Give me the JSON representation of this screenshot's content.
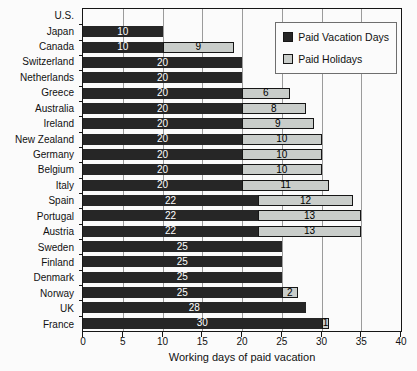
{
  "chart_data": {
    "type": "bar",
    "orientation": "horizontal",
    "stacked": true,
    "title": "",
    "xlabel": "Working days of paid vacation",
    "xlim": [
      0,
      40
    ],
    "xticks": [
      0,
      5,
      10,
      15,
      20,
      25,
      30,
      35,
      40
    ],
    "grid": "vertical",
    "legend_position": "top-right",
    "categories": [
      "U.S.",
      "Japan",
      "Canada",
      "Switzerland",
      "Netherlands",
      "Greece",
      "Australia",
      "Ireland",
      "New Zealand",
      "Germany",
      "Belgium",
      "Italy",
      "Spain",
      "Portugal",
      "Austria",
      "Sweden",
      "Finland",
      "Denmark",
      "Norway",
      "UK",
      "France"
    ],
    "series": [
      {
        "name": "Paid Vacation Days",
        "color": "#262626",
        "label_color": "#ffffff",
        "values": [
          0,
          10,
          10,
          20,
          20,
          20,
          20,
          20,
          20,
          20,
          20,
          20,
          22,
          22,
          22,
          25,
          25,
          25,
          25,
          28,
          30
        ]
      },
      {
        "name": "Paid Holidays",
        "color": "#c9cdca",
        "label_color": "#000000",
        "values": [
          0,
          0,
          9,
          0,
          0,
          6,
          8,
          9,
          10,
          10,
          10,
          11,
          12,
          13,
          13,
          0,
          0,
          0,
          2,
          0,
          1
        ]
      }
    ],
    "colors": {
      "grid": "#9b9b9b",
      "plot_border": "#161616",
      "background": "#fbfbfb"
    }
  }
}
